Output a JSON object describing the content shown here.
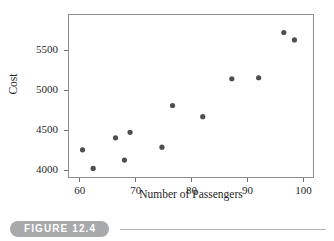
{
  "figure": {
    "caption_label": "FIGURE 12.4",
    "pill_color": "#a8a9ab",
    "rule_color": "#b4b5b7"
  },
  "chart_data": {
    "type": "scatter",
    "title": "",
    "xlabel": "Number of Passengers",
    "ylabel": "Cost",
    "xlim": [
      57.9,
      101.9
    ],
    "ylim": [
      3903,
      5950
    ],
    "xticks": [
      60,
      70,
      80,
      90,
      100
    ],
    "xtick_labels": [
      "60",
      "70",
      "80",
      "90",
      "100"
    ],
    "yticks": [
      4000,
      4500,
      5000,
      5500
    ],
    "ytick_labels": [
      "4000",
      "4500",
      "5000",
      "5500"
    ],
    "grid": false,
    "legend": null,
    "point_color": "#4e4e52",
    "point_radius": 2.6,
    "frame": true,
    "x": [
      60.5,
      62.4,
      66.4,
      68.0,
      69.0,
      74.7,
      76.6,
      82.0,
      87.2,
      92.0,
      96.5,
      98.4
    ],
    "y": [
      4255,
      4023,
      4404,
      4127,
      4473,
      4288,
      4808,
      4669,
      5142,
      5154,
      5719,
      5627
    ],
    "points": [
      {
        "x": 60.5,
        "y": 4255
      },
      {
        "x": 62.4,
        "y": 4023
      },
      {
        "x": 66.4,
        "y": 4404
      },
      {
        "x": 68.0,
        "y": 4127
      },
      {
        "x": 69.0,
        "y": 4473
      },
      {
        "x": 74.7,
        "y": 4288
      },
      {
        "x": 76.6,
        "y": 4808
      },
      {
        "x": 82.0,
        "y": 4669
      },
      {
        "x": 87.2,
        "y": 5142
      },
      {
        "x": 92.0,
        "y": 5154
      },
      {
        "x": 96.5,
        "y": 5719
      },
      {
        "x": 98.4,
        "y": 5627
      }
    ],
    "n_points": 12
  }
}
